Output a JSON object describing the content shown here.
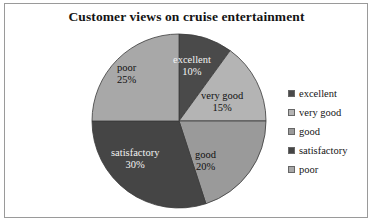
{
  "chart_data": {
    "type": "pie",
    "title": "Customer views on cruise entertainment",
    "xlabel": "",
    "ylabel": "",
    "legend_position": "right",
    "grid": false,
    "start_angle_deg": 0,
    "direction": "clockwise",
    "categories": [
      "excellent",
      "very good",
      "good",
      "satisfactory",
      "poor"
    ],
    "values": [
      10,
      15,
      20,
      30,
      25
    ],
    "value_unit": "%",
    "slices": [
      {
        "label": "excellent",
        "value": 10,
        "value_text": "10%",
        "color": "#4a4a4a",
        "label_on_dark": true,
        "label_left": 82,
        "label_top": 21
      },
      {
        "label": "very good",
        "value": 15,
        "value_text": "15%",
        "color": "#b4b4b4",
        "label_on_dark": false,
        "label_left": 110,
        "label_top": 57
      },
      {
        "label": "good",
        "value": 20,
        "value_text": "20%",
        "color": "#9a9a9a",
        "label_on_dark": false,
        "label_left": 104,
        "label_top": 116
      },
      {
        "label": "satisfactory",
        "value": 30,
        "value_text": "30%",
        "color": "#454545",
        "label_on_dark": true,
        "label_left": 20,
        "label_top": 114
      },
      {
        "label": "poor",
        "value": 25,
        "value_text": "25%",
        "color": "#a8a8a8",
        "label_on_dark": false,
        "label_left": 26,
        "label_top": 29
      }
    ]
  },
  "legend": {
    "items": [
      {
        "label": "excellent",
        "color": "#4a4a4a"
      },
      {
        "label": "very good",
        "color": "#b4b4b4"
      },
      {
        "label": "good",
        "color": "#9a9a9a"
      },
      {
        "label": "satisfactory",
        "color": "#454545"
      },
      {
        "label": "poor",
        "color": "#a8a8a8"
      }
    ]
  },
  "colors": {
    "background": "#ffffff",
    "frame_border": "#9a9a9a",
    "slice_outline": "#3a3a3a",
    "title_text": "#141414"
  }
}
